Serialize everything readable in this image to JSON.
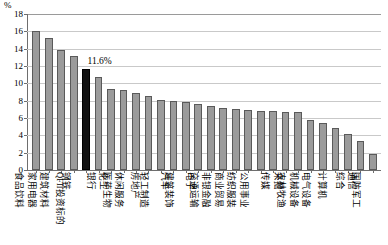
{
  "chart_data": {
    "type": "bar",
    "title": "",
    "xlabel": "",
    "ylabel": "%",
    "ylim": [
      0,
      18
    ],
    "ytick_step": 2,
    "yticks": [
      "18",
      "16",
      "14",
      "12",
      "10",
      "8",
      "6",
      "4",
      "2",
      "0"
    ],
    "grid": true,
    "legend": "none",
    "highlight_category": "QFII投资标的",
    "highlight_value_label": "11.6%",
    "bar_color": "#9b9b9b",
    "bar_border_color": "#5a5a5a",
    "highlight_color": "#121212",
    "categories": [
      "食品饮料",
      "家用电器",
      "建筑材料",
      "钢铁",
      "QFII投资标的",
      "银行",
      "化工",
      "医药生物",
      "休闲服务",
      "房地产",
      "轻工制造",
      "汽车",
      "建筑装饰",
      "电子",
      "交通运输",
      "非银金融",
      "商业贸易",
      "纺织服装",
      "公用事业",
      "传媒",
      "采掘",
      "农林牧渔",
      "机械设备",
      "电气设备",
      "计算机",
      "综合",
      "通信",
      "国防军工"
    ],
    "values": [
      16.0,
      15.2,
      13.8,
      13.2,
      11.6,
      10.7,
      9.4,
      9.2,
      8.9,
      8.5,
      8.1,
      8.0,
      7.9,
      7.6,
      7.4,
      7.2,
      7.0,
      6.9,
      6.8,
      6.8,
      6.7,
      6.7,
      5.8,
      5.4,
      4.9,
      4.2,
      3.4,
      1.9
    ]
  }
}
